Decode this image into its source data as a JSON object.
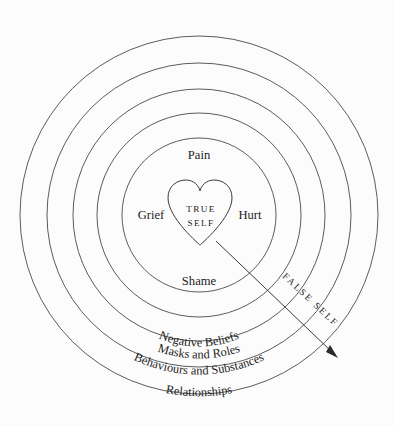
{
  "diagram": {
    "background_color": "#fcfcfc",
    "line_color": "#4a4a4a",
    "text_color": "#1c1c1c",
    "center": {
      "x": 199,
      "y": 215
    },
    "core": {
      "shape": "heart",
      "label_line1": "TRUE",
      "label_line2": "SELF"
    },
    "inner_labels": [
      {
        "text": "Pain",
        "position": "top",
        "x": 199,
        "y": 159
      },
      {
        "text": "Grief",
        "position": "left",
        "x": 151,
        "y": 219
      },
      {
        "text": "Hurt",
        "position": "right",
        "x": 250,
        "y": 219
      },
      {
        "text": "Shame",
        "position": "bottom",
        "x": 199,
        "y": 284
      }
    ],
    "rings": [
      {
        "index": 1,
        "label": "Negative Beliefs",
        "radius": 102
      },
      {
        "index": 2,
        "label": "Masks and Roles",
        "radius": 126
      },
      {
        "index": 3,
        "label": "Behaviours and Substances",
        "radius": 152
      },
      {
        "index": 4,
        "label": "Relationships",
        "radius": 179
      }
    ],
    "ring_radii": [
      77,
      102,
      126,
      152,
      179
    ],
    "arrow": {
      "label": "FALSE SELF",
      "from": {
        "x": 216,
        "y": 243
      },
      "to": {
        "x": 337,
        "y": 357
      },
      "direction": "outward"
    }
  }
}
